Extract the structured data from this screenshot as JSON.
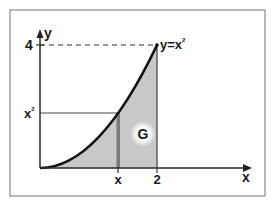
{
  "diagram": {
    "type": "area-under-curve",
    "curve_label": "y=x",
    "curve_label_exponent": "2",
    "x_axis_label": "x",
    "y_axis_label": "y",
    "y_tick_label": "4",
    "left_tick_label": "x",
    "left_tick_exponent": "2",
    "x_ticks": [
      {
        "label": "x"
      },
      {
        "label": "2"
      }
    ],
    "region_label": "G",
    "colors": {
      "frame": "#8a8a8a",
      "axis": "#2a2a2a",
      "curve": "#1a1a1a",
      "fill": "#c8c8c8",
      "line": "#555555"
    }
  }
}
